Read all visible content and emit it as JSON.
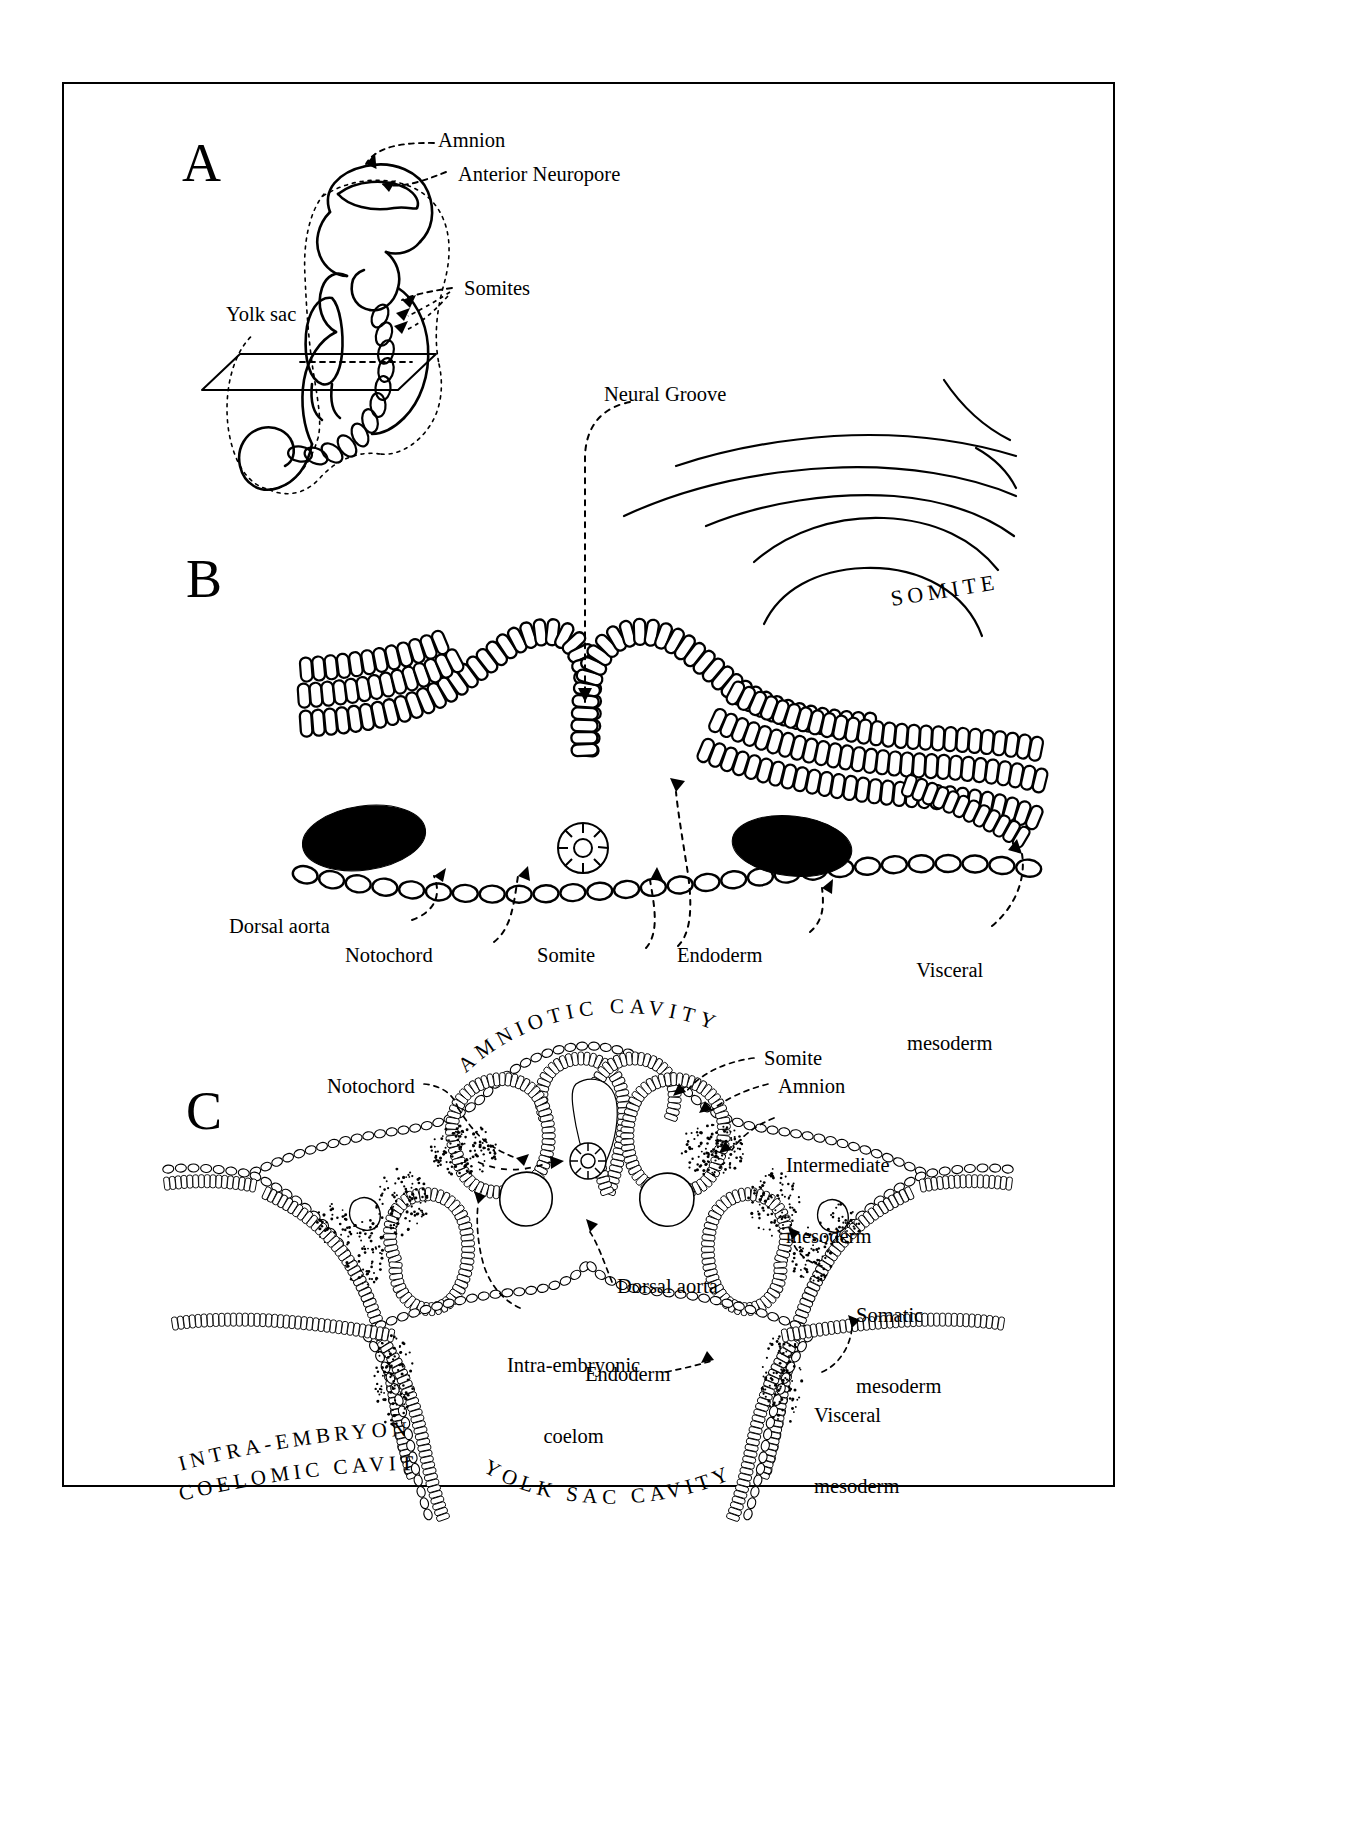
{
  "figure": {
    "kind": "embryology-diagram",
    "background": "#ffffff",
    "ink": "#000000"
  },
  "panels": [
    {
      "id": "A",
      "letter": "A",
      "title": "Whole embryo with amnion and somites",
      "labels": [
        {
          "name": "amnion",
          "text": "Amnion"
        },
        {
          "name": "anterior-neuropore",
          "text": "Anterior Neuropore"
        },
        {
          "name": "somites",
          "text": "Somites"
        },
        {
          "name": "yolk-sac",
          "text": "Yolk sac"
        }
      ]
    },
    {
      "id": "B",
      "letter": "B",
      "title": "Transverse section - neural groove stage",
      "labels": [
        {
          "name": "neural-groove",
          "text": "Neural Groove"
        },
        {
          "name": "somite-caps",
          "text": "SOMITE"
        },
        {
          "name": "dorsal-aorta",
          "text": "Dorsal aorta"
        },
        {
          "name": "notochord",
          "text": "Notochord"
        },
        {
          "name": "somite",
          "text": "Somite"
        },
        {
          "name": "endoderm",
          "text": "Endoderm"
        },
        {
          "name": "visceral-mesoderm",
          "text": "Visceral\nmesoderm"
        }
      ]
    },
    {
      "id": "C",
      "letter": "C",
      "title": "Transverse section - neural tube and coelom stage",
      "labels": [
        {
          "name": "amniotic-cavity",
          "text": "AMNIOTIC CAVITY"
        },
        {
          "name": "notochord",
          "text": "Notochord"
        },
        {
          "name": "somite",
          "text": "Somite"
        },
        {
          "name": "amnion",
          "text": "Amnion"
        },
        {
          "name": "intermediate-mesoderm",
          "text": "Intermediate\nmesoderm"
        },
        {
          "name": "intra-embryonic-coelomic-cavity-1",
          "text": "INTRA-EMBRYONIC"
        },
        {
          "name": "intra-embryonic-coelomic-cavity-2",
          "text": "COELOMIC CAVITY"
        },
        {
          "name": "dorsal-aorta",
          "text": "Dorsal aorta"
        },
        {
          "name": "intra-embryonic-coelom",
          "text": "Intra-embryonic\ncoelom"
        },
        {
          "name": "endoderm",
          "text": "Endoderm"
        },
        {
          "name": "somatic-mesoderm",
          "text": "Somatic\nmesoderm"
        },
        {
          "name": "visceral-mesoderm",
          "text": "Visceral\nmesoderm"
        },
        {
          "name": "yolk-sac-cavity",
          "text": "YOLK SAC CAVITY"
        }
      ]
    }
  ],
  "panelA": {
    "letter": "A",
    "amnion": "Amnion",
    "anterior_neuropore": "Anterior Neuropore",
    "somites": "Somites",
    "yolk_sac": "Yolk sac"
  },
  "panelB": {
    "letter": "B",
    "neural_groove": "Neural Groove",
    "somite_caps": "SOMITE",
    "dorsal_aorta": "Dorsal aorta",
    "notochord": "Notochord",
    "somite": "Somite",
    "endoderm": "Endoderm",
    "visceral_mesoderm_l1": "Visceral",
    "visceral_mesoderm_l2": "mesoderm"
  },
  "panelC": {
    "letter": "C",
    "amniotic_cavity": "AMNIOTIC CAVITY",
    "notochord": "Notochord",
    "somite": "Somite",
    "amnion": "Amnion",
    "intermediate_mesoderm_l1": "Intermediate",
    "intermediate_mesoderm_l2": "mesoderm",
    "coelomic_cavity_l1": "INTRA-EMBRYONIC",
    "coelomic_cavity_l2": "COELOMIC CAVITY",
    "dorsal_aorta": "Dorsal aorta",
    "intra_embryonic_coelom_l1": "Intra-embryonic",
    "intra_embryonic_coelom_l2": "coelom",
    "endoderm": "Endoderm",
    "somatic_mesoderm_l1": "Somatic",
    "somatic_mesoderm_l2": "mesoderm",
    "visceral_mesoderm_l1": "Visceral",
    "visceral_mesoderm_l2": "mesoderm",
    "yolk_sac_cavity": "YOLK SAC CAVITY"
  }
}
